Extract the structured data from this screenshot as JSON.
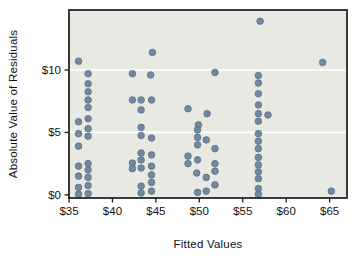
{
  "figure": {
    "xlabel": "Fitted Values",
    "ylabel": "Absolute Value of Residuals"
  },
  "chart_data": {
    "type": "scatter",
    "title": "",
    "xlabel": "Fitted Values",
    "ylabel": "Absolute Value of Residuals",
    "xlim": [
      35,
      67
    ],
    "ylim": [
      -0.25,
      14.8
    ],
    "x_ticks": [
      {
        "value": 35,
        "label": "$35"
      },
      {
        "value": 40,
        "label": "$40"
      },
      {
        "value": 45,
        "label": "$45"
      },
      {
        "value": 50,
        "label": "$50"
      },
      {
        "value": 55,
        "label": "$55"
      },
      {
        "value": 60,
        "label": "$60"
      },
      {
        "value": 65,
        "label": "$65"
      }
    ],
    "y_ticks": [
      {
        "value": 0,
        "label": "$0"
      },
      {
        "value": 5,
        "label": "$5"
      },
      {
        "value": 10,
        "label": "$10"
      }
    ],
    "gridlines_y": [
      5,
      10
    ],
    "grid_on": true,
    "legend": "none",
    "colors": {
      "plot_bg": "#E9E9E4",
      "grid": "#FFFFFF",
      "point_fill": "#74889E",
      "point_stroke": "#54708C",
      "axis": "#1A1A1A",
      "text": "#111111"
    },
    "points": [
      [
        36.1,
        10.7
      ],
      [
        36.1,
        5.85
      ],
      [
        36.1,
        4.9
      ],
      [
        36.1,
        3.9
      ],
      [
        36.1,
        2.3
      ],
      [
        36.1,
        1.5
      ],
      [
        36.1,
        0.6
      ],
      [
        36.1,
        0.05
      ],
      [
        37.2,
        9.7
      ],
      [
        37.2,
        8.9
      ],
      [
        37.2,
        8.25
      ],
      [
        37.2,
        7.6
      ],
      [
        37.2,
        7.0
      ],
      [
        37.2,
        6.1
      ],
      [
        37.2,
        5.3
      ],
      [
        37.2,
        4.7
      ],
      [
        37.2,
        2.5
      ],
      [
        37.2,
        2.0
      ],
      [
        37.2,
        1.4
      ],
      [
        37.2,
        0.75
      ],
      [
        37.2,
        0.1
      ],
      [
        42.3,
        9.7
      ],
      [
        42.3,
        7.6
      ],
      [
        42.3,
        2.55
      ],
      [
        42.3,
        2.1
      ],
      [
        43.3,
        7.6
      ],
      [
        43.3,
        6.8
      ],
      [
        43.3,
        5.4
      ],
      [
        43.3,
        4.75
      ],
      [
        43.3,
        3.35
      ],
      [
        43.3,
        2.8
      ],
      [
        43.3,
        2.15
      ],
      [
        43.3,
        0.7
      ],
      [
        43.3,
        0.15
      ],
      [
        44.6,
        11.4
      ],
      [
        44.4,
        9.6
      ],
      [
        44.5,
        7.6
      ],
      [
        44.5,
        4.55
      ],
      [
        44.5,
        3.2
      ],
      [
        44.5,
        2.3
      ],
      [
        44.5,
        1.6
      ],
      [
        44.5,
        1.0
      ],
      [
        44.5,
        0.3
      ],
      [
        48.7,
        6.9
      ],
      [
        48.7,
        3.1
      ],
      [
        48.7,
        2.5
      ],
      [
        49.9,
        5.6
      ],
      [
        49.8,
        5.2
      ],
      [
        49.8,
        4.6
      ],
      [
        49.8,
        4.0
      ],
      [
        49.8,
        2.8
      ],
      [
        49.7,
        1.75
      ],
      [
        49.8,
        0.2
      ],
      [
        50.9,
        6.5
      ],
      [
        50.8,
        4.4
      ],
      [
        50.8,
        1.4
      ],
      [
        50.8,
        0.3
      ],
      [
        51.8,
        9.8
      ],
      [
        51.8,
        3.7
      ],
      [
        51.8,
        2.5
      ],
      [
        51.8,
        1.9
      ],
      [
        51.8,
        0.8
      ],
      [
        57.0,
        13.9
      ],
      [
        56.8,
        9.55
      ],
      [
        56.8,
        8.95
      ],
      [
        56.8,
        8.1
      ],
      [
        56.8,
        7.2
      ],
      [
        56.8,
        6.5
      ],
      [
        56.8,
        5.9
      ],
      [
        56.8,
        4.9
      ],
      [
        56.8,
        4.3
      ],
      [
        56.8,
        3.7
      ],
      [
        56.8,
        3.0
      ],
      [
        56.8,
        2.4
      ],
      [
        56.8,
        1.85
      ],
      [
        56.8,
        1.3
      ],
      [
        56.8,
        0.5
      ],
      [
        56.8,
        0.05
      ],
      [
        57.9,
        6.4
      ],
      [
        64.2,
        10.6
      ],
      [
        65.2,
        0.3
      ]
    ]
  }
}
